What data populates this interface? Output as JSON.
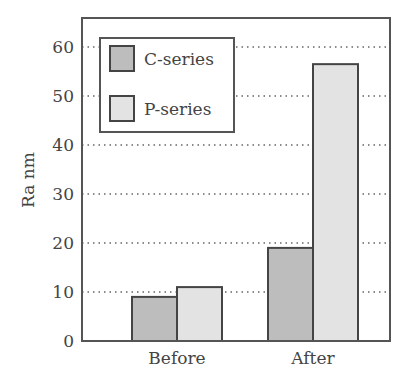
{
  "chart_data": {
    "type": "bar",
    "title": "",
    "xlabel": "",
    "ylabel": "Ra nm",
    "ylim": [
      0,
      65
    ],
    "yticks": [
      0,
      10,
      20,
      30,
      40,
      50,
      60
    ],
    "ytick_labels": [
      "0",
      "10",
      "20",
      "30",
      "40",
      "50",
      "60"
    ],
    "grid": "horizontal dotted",
    "categories": [
      "Before",
      "After"
    ],
    "series": [
      {
        "name": "C-series",
        "values": [
          9,
          19
        ],
        "color": "#bdbdbd"
      },
      {
        "name": "P-series",
        "values": [
          11,
          56.5
        ],
        "color": "#e3e3e3"
      }
    ],
    "legend": {
      "position": "upper-left",
      "entries": [
        "C-series",
        "P-series"
      ]
    }
  }
}
